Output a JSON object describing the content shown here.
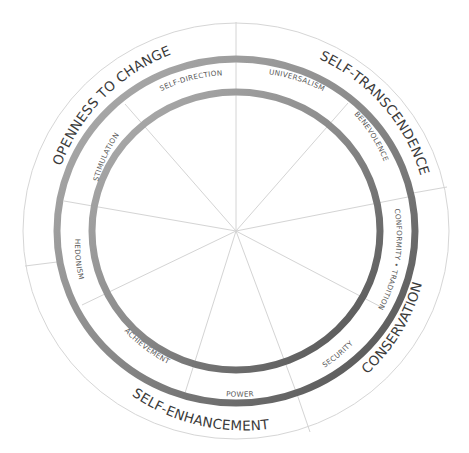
{
  "diagram": {
    "colors": {
      "background": "#ffffff",
      "thin_lines": "#d6d6d6",
      "ring_light": "#a8a8a8",
      "ring_dark": "#555555",
      "category_text": "#3a3a3a",
      "value_text": "#5a5a5a"
    },
    "categories": [
      {
        "id": "openness",
        "label": "OPENNESS TO CHANGE"
      },
      {
        "id": "self-transcendence",
        "label": "SELF-TRANSCENDENCE"
      },
      {
        "id": "conservation",
        "label": "CONSERVATION"
      },
      {
        "id": "self-enhancement",
        "label": "SELF-ENHANCEMENT"
      }
    ],
    "values": [
      {
        "id": "self-direction",
        "label": "SELF-DIRECTION"
      },
      {
        "id": "universalism",
        "label": "UNIVERSALISM"
      },
      {
        "id": "benevolence",
        "label": "BENEVOLENCE"
      },
      {
        "id": "conformity-tradition",
        "label": "CONFORMITY • TRADITION"
      },
      {
        "id": "security",
        "label": "SECURITY"
      },
      {
        "id": "power",
        "label": "POWER"
      },
      {
        "id": "achievement",
        "label": "ACHIEVEMENT"
      },
      {
        "id": "hedonism",
        "label": "HEDONISM"
      },
      {
        "id": "stimulation",
        "label": "STIMULATION"
      }
    ]
  }
}
